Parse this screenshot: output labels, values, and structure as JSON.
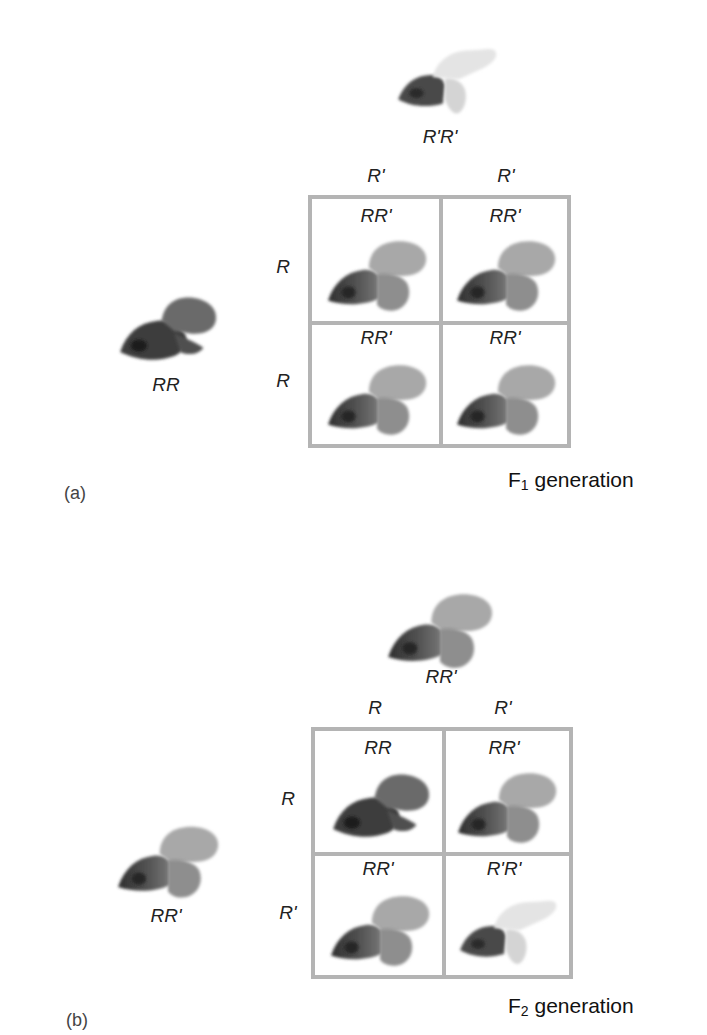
{
  "panels": [
    {
      "label": "(a)",
      "generation": {
        "prefix": "F",
        "subscript": "1",
        "suffix": " generation"
      },
      "parent_top": {
        "genotype": "R'R'",
        "flower": "white-flower"
      },
      "parent_left": {
        "genotype": "RR",
        "flower": "red-flower"
      },
      "column_alleles": [
        "R'",
        "R'"
      ],
      "row_alleles": [
        "R",
        "R"
      ],
      "cells": [
        [
          {
            "genotype": "RR'",
            "flower": "pink-flower"
          },
          {
            "genotype": "RR'",
            "flower": "pink-flower"
          }
        ],
        [
          {
            "genotype": "RR'",
            "flower": "pink-flower"
          },
          {
            "genotype": "RR'",
            "flower": "pink-flower"
          }
        ]
      ]
    },
    {
      "label": "(b)",
      "generation": {
        "prefix": "F",
        "subscript": "2",
        "suffix": " generation"
      },
      "parent_top": {
        "genotype": "RR'",
        "flower": "pink-flower"
      },
      "parent_left": {
        "genotype": "RR'",
        "flower": "pink-flower"
      },
      "column_alleles": [
        "R",
        "R'"
      ],
      "row_alleles": [
        "R",
        "R'"
      ],
      "cells": [
        [
          {
            "genotype": "RR",
            "flower": "red-flower"
          },
          {
            "genotype": "RR'",
            "flower": "pink-flower"
          }
        ],
        [
          {
            "genotype": "RR'",
            "flower": "pink-flower"
          },
          {
            "genotype": "R'R'",
            "flower": "white-flower"
          }
        ]
      ]
    }
  ],
  "colors": {
    "red_flower": "#5a5a5a",
    "pink_flower": "#9a9a9a",
    "white_flower": "#e2e2e2",
    "grid_border": "#b4b4b4"
  }
}
